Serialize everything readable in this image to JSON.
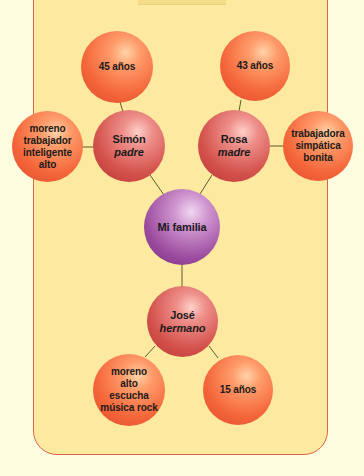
{
  "diagram": {
    "title": "Mi familia",
    "colors": {
      "background": "#fffde0",
      "panel": "#fdeaa0",
      "border": "#e0634a",
      "link": "#5a5a2a",
      "attribute_node": "#f4663a",
      "person_node": "#d4524c",
      "center_node": "#9b4b9e"
    },
    "center": {
      "label": "Mi familia"
    },
    "father": {
      "name": "Simón",
      "role": "padre",
      "age": "45 años",
      "traits": [
        "moreno",
        "trabajador",
        "inteligente",
        "alto"
      ]
    },
    "mother": {
      "name": "Rosa",
      "role": "madre",
      "age": "43 años",
      "traits": [
        "trabajadora",
        "simpática",
        "bonita"
      ]
    },
    "brother": {
      "name": "José",
      "role": "hermano",
      "age": "15 años",
      "traits": [
        "moreno",
        "alto",
        "escucha",
        "música rock"
      ]
    }
  }
}
